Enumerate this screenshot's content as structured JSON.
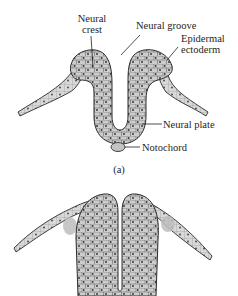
{
  "figure_a": {
    "panel_label": "(a)",
    "labels": {
      "neural_crest_line1": "Neural",
      "neural_crest_line2": "crest",
      "neural_groove": "Neural groove",
      "epidermal_line1": "Epidermal",
      "epidermal_line2": "ectoderm",
      "neural_plate": "Neural plate",
      "notochord": "Notochord"
    }
  },
  "figure_b": {
    "panel_label": ""
  },
  "colors": {
    "tissue_fill": "#c9c9c9",
    "outline": "#2b2b2b",
    "nucleus": "#3a3a3a",
    "background": "#ffffff"
  }
}
